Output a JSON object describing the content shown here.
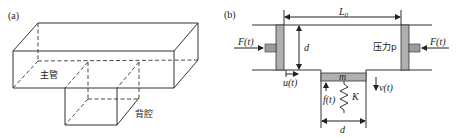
{
  "panel_a": {
    "label": "(a)",
    "main_pipe_label": "主管",
    "back_cavity_label": "背腔"
  },
  "panel_b": {
    "label": "(b)",
    "length_label": "L",
    "length_sub": "0",
    "height_label": "d",
    "force_left": "F(t)",
    "force_right": "F(t)",
    "pressure_label": "压力p",
    "u_label": "u(t)",
    "v_label": "v(t)",
    "f_label": "f(t)",
    "mass_label": "m",
    "spring_label": "K",
    "width_label": "d"
  },
  "colors": {
    "line": "#333333",
    "piston_fill": "#9a9a9a",
    "mass_fill": "#c8c8c8"
  }
}
